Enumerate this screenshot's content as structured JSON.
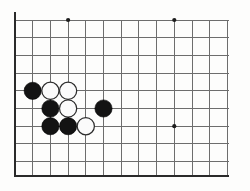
{
  "board": {
    "title": "Go board corner diagram",
    "background_color": "#fdfdfc",
    "grid_line_color": "#6d6d6d",
    "edge_line_color": "#2a2a2a",
    "black_stone_color": "#131313",
    "white_stone_color": "#fbfbfb",
    "white_stone_outline_color": "#2c2c2c",
    "star_point_color": "#1d1d1d",
    "geometry": {
      "origin_x": 15,
      "origin_y": 20,
      "spacing": 17.7,
      "columns": 13,
      "rows": 10,
      "stone_radius": 8.6,
      "star_point_radius": 2.1,
      "left_edge_x": 15,
      "bottom_edge_y": 176,
      "right_clip_x": 229,
      "top_line_y": 20
    },
    "star_points": [
      {
        "name": "hoshi-top-left",
        "col": 3,
        "row": 0
      },
      {
        "name": "hoshi-top-right",
        "col": 9,
        "row": 0
      },
      {
        "name": "hoshi-bottom-right",
        "col": 9,
        "row": 6
      }
    ],
    "stones": [
      {
        "name": "stone-black-1",
        "color": "black",
        "col": 1,
        "row": 4
      },
      {
        "name": "stone-white-1",
        "color": "white",
        "col": 2,
        "row": 4
      },
      {
        "name": "stone-white-2",
        "color": "white",
        "col": 3,
        "row": 4
      },
      {
        "name": "stone-black-2",
        "color": "black",
        "col": 2,
        "row": 5
      },
      {
        "name": "stone-white-3",
        "color": "white",
        "col": 3,
        "row": 5
      },
      {
        "name": "stone-black-3",
        "color": "black",
        "col": 5,
        "row": 5
      },
      {
        "name": "stone-black-4",
        "color": "black",
        "col": 2,
        "row": 6
      },
      {
        "name": "stone-black-5",
        "color": "black",
        "col": 3,
        "row": 6
      },
      {
        "name": "stone-white-4",
        "color": "white",
        "col": 4,
        "row": 6
      }
    ],
    "counts": {
      "black_stones": 5,
      "white_stones": 4,
      "total_stones": 9
    }
  }
}
